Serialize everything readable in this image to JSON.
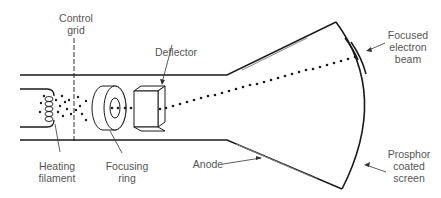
{
  "diagram": {
    "labels": {
      "control_grid": "Control\ngrid",
      "deflector": "Deflector",
      "focused_beam": "Focused\nelectron\nbeam",
      "heating_filament": "Heating\nfilament",
      "focusing_ring": "Focusing\nring",
      "anode": "Anode",
      "screen": "Prosphor\ncoated\nscreen"
    },
    "colors": {
      "line": "#1a1a1a",
      "label": "#555555",
      "anode_line": "#888888"
    }
  }
}
